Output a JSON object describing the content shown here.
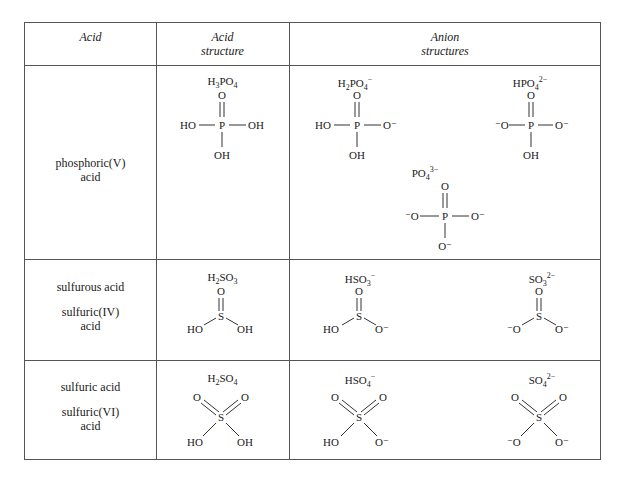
{
  "table": {
    "headers": {
      "acid": "Acid",
      "acid_structure_line1": "Acid",
      "acid_structure_line2": "structure",
      "anion_line1": "Anion",
      "anion_line2": "structures"
    },
    "rows": [
      {
        "acid_name_line1": "phosphoric(V)",
        "acid_name_line2": "acid",
        "acid_formula": {
          "main": "H",
          "s1": "3",
          "mid": "PO",
          "s2": "4",
          "sup": ""
        },
        "anions": [
          {
            "main": "H",
            "s1": "2",
            "mid": "PO",
            "s2": "4",
            "sup": "−"
          },
          {
            "main": "HPO",
            "s1": "4",
            "mid": "",
            "s2": "",
            "sup": "2−"
          },
          {
            "main": "PO",
            "s1": "4",
            "mid": "",
            "s2": "",
            "sup": "3−"
          }
        ]
      },
      {
        "acid_name_line1": "sulfurous acid",
        "acid_name_line2": "sulfuric(IV)",
        "acid_name_line3": "acid",
        "acid_formula": {
          "main": "H",
          "s1": "2",
          "mid": "SO",
          "s2": "3",
          "sup": ""
        },
        "anions": [
          {
            "main": "HSO",
            "s1": "3",
            "mid": "",
            "s2": "",
            "sup": "−"
          },
          {
            "main": "SO",
            "s1": "3",
            "mid": "",
            "s2": "",
            "sup": "2−"
          }
        ]
      },
      {
        "acid_name_line1": "sulfuric acid",
        "acid_name_line2": "sulfuric(VI)",
        "acid_name_line3": "acid",
        "acid_formula": {
          "main": "H",
          "s1": "2",
          "mid": "SO",
          "s2": "4",
          "sup": ""
        },
        "anions": [
          {
            "main": "HSO",
            "s1": "4",
            "mid": "",
            "s2": "",
            "sup": "−"
          },
          {
            "main": "SO",
            "s1": "4",
            "mid": "",
            "s2": "",
            "sup": "2−"
          }
        ]
      }
    ],
    "atoms": {
      "O": "O",
      "P": "P",
      "S": "S",
      "OH": "OH",
      "HO": "HO",
      "O_minus": "O⁻",
      "minus_O": "⁻O"
    }
  }
}
